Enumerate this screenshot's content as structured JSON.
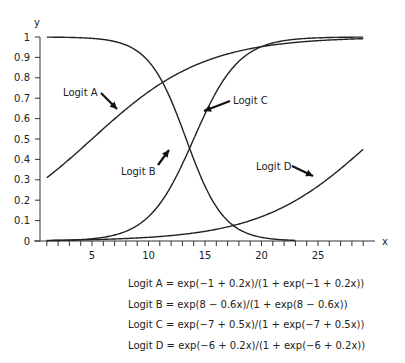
{
  "chart_data": {
    "type": "line",
    "title": "",
    "xlabel": "x",
    "ylabel": "y",
    "xlim": [
      1,
      29
    ],
    "ylim": [
      0,
      1
    ],
    "x_ticks": [
      5,
      10,
      15,
      20,
      25
    ],
    "y_ticks": [
      "0",
      "0.1",
      "0.2",
      "0.3",
      "0.4",
      "0.5",
      "0.6",
      "0.7",
      "0.8",
      "0.9",
      "1"
    ],
    "grid": false,
    "legend": "annotations with arrows",
    "series": [
      {
        "name": "Logit A",
        "a": -1,
        "b": 0.2,
        "x_range": [
          1,
          29
        ],
        "formula": "Logit A = exp(−1 + 0.2x)/(1 + exp(−1 + 0.2x))"
      },
      {
        "name": "Logit B",
        "a": 8,
        "b": -0.6,
        "x_range": [
          1,
          23
        ],
        "formula": "Logit B = exp(8 − 0.6x)/(1 + exp(8 − 0.6x))"
      },
      {
        "name": "Logit C",
        "a": -7,
        "b": 0.5,
        "x_range": [
          1,
          29
        ],
        "formula": "Logit C = exp(−7 + 0.5x)/(1 + exp(−7 + 0.5x))"
      },
      {
        "name": "Logit D",
        "a": -6,
        "b": 0.2,
        "x_range": [
          1,
          29
        ],
        "formula": "Logit D = exp(−6 + 0.2x)/(1 + exp(−6 + 0.2x))"
      }
    ],
    "annotations": [
      {
        "label": "Logit A",
        "target_series": 0
      },
      {
        "label": "Logit B",
        "target_series": 1
      },
      {
        "label": "Logit C",
        "target_series": 2
      },
      {
        "label": "Logit D",
        "target_series": 3
      }
    ]
  },
  "labels": {
    "x_axis": "x",
    "y_axis": "y",
    "logit_a": "Logit A",
    "logit_b": "Logit B",
    "logit_c": "Logit C",
    "logit_d": "Logit D"
  },
  "equations": [
    "Logit A = exp(−1 + 0.2x)/(1 + exp(−1 + 0.2x))",
    "Logit B = exp(8 − 0.6x)/(1 + exp(8 − 0.6x))",
    "Logit C = exp(−7 + 0.5x)/(1 + exp(−7 + 0.5x))",
    "Logit D = exp(−6 + 0.2x)/(1 + exp(−6 + 0.2x))"
  ]
}
